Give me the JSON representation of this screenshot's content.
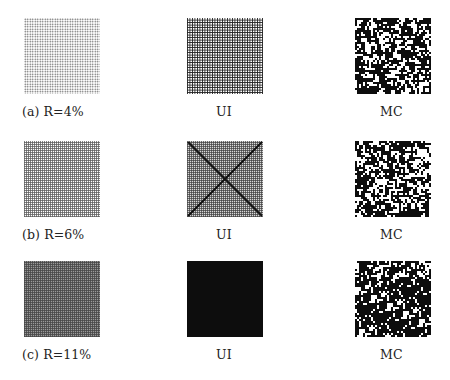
{
  "figure": {
    "rows": [
      {
        "id": "a",
        "panels": [
          {
            "label": "(a) R=4%",
            "pattern": "sparse-dot-grid",
            "kind": "reference"
          },
          {
            "label": "UI",
            "pattern": "dark-checker-grid",
            "kind": "UI"
          },
          {
            "label": "MC",
            "pattern": "random-speckle",
            "kind": "MC"
          }
        ]
      },
      {
        "id": "b",
        "panels": [
          {
            "label": "(b) R=6%",
            "pattern": "light-grid",
            "kind": "reference"
          },
          {
            "label": "UI",
            "pattern": "grid-with-diagonal-cross",
            "kind": "UI"
          },
          {
            "label": "MC",
            "pattern": "random-speckle",
            "kind": "MC"
          }
        ]
      },
      {
        "id": "c",
        "panels": [
          {
            "label": "(c) R=11%",
            "pattern": "dense-grid",
            "kind": "reference"
          },
          {
            "label": "UI",
            "pattern": "solid-black",
            "kind": "UI"
          },
          {
            "label": "MC",
            "pattern": "random-speckle",
            "kind": "MC"
          }
        ]
      }
    ],
    "colors": {
      "background": "#ffffff",
      "ink": "#0d0d0d",
      "text": "#222222"
    }
  }
}
